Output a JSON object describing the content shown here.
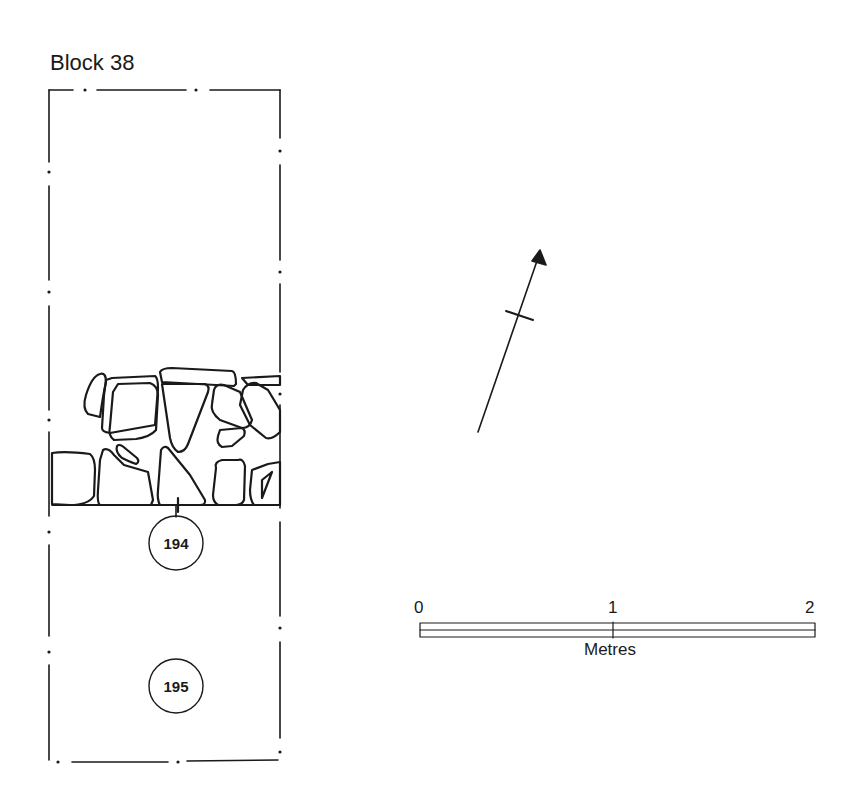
{
  "title": "Block 38",
  "contexts": [
    {
      "id": "194",
      "x": 163,
      "y": 543
    },
    {
      "id": "195",
      "x": 163,
      "y": 686
    }
  ],
  "north_arrow": {
    "label": "north-arrow"
  },
  "scale_bar": {
    "ticks": [
      "0",
      "1",
      "2"
    ],
    "unit": "Metres"
  },
  "colors": {
    "ink": "#1a1a1a",
    "background": "#ffffff"
  }
}
